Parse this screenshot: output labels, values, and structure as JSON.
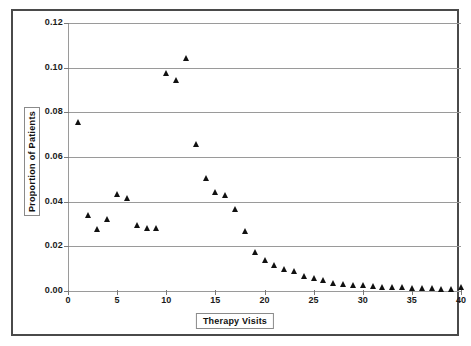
{
  "chart_data": {
    "type": "scatter",
    "title": "",
    "xlabel": "Therapy Visits",
    "ylabel": "Proportion of Patients",
    "xlim": [
      0,
      40
    ],
    "ylim": [
      0.0,
      0.12
    ],
    "grid": true,
    "legend": null,
    "marker": "triangle",
    "marker_color": "#111111",
    "x_ticks": [
      0,
      5,
      10,
      15,
      20,
      25,
      30,
      35,
      40
    ],
    "x_tick_labels": [
      "0",
      "5",
      "10",
      "15",
      "20",
      "25",
      "30",
      "35",
      "40"
    ],
    "y_ticks": [
      0.0,
      0.02,
      0.04,
      0.06,
      0.08,
      0.1,
      0.12
    ],
    "y_tick_labels": [
      "0.00",
      "0.02",
      "0.04",
      "0.06",
      "0.08",
      "0.10",
      "0.12"
    ],
    "x": [
      1,
      2,
      3,
      4,
      5,
      6,
      7,
      8,
      9,
      10,
      11,
      12,
      13,
      14,
      15,
      16,
      17,
      18,
      19,
      20,
      21,
      22,
      23,
      24,
      25,
      26,
      27,
      28,
      29,
      30,
      31,
      32,
      33,
      34,
      35,
      36,
      37,
      38,
      39,
      40
    ],
    "y": [
      0.0755,
      0.034,
      0.0278,
      0.0322,
      0.0435,
      0.0415,
      0.0295,
      0.0282,
      0.0283,
      0.0975,
      0.0945,
      0.1045,
      0.066,
      0.0505,
      0.0443,
      0.0428,
      0.0365,
      0.0268,
      0.0175,
      0.014,
      0.0118,
      0.0097,
      0.0088,
      0.0068,
      0.006,
      0.005,
      0.0038,
      0.003,
      0.0025,
      0.0025,
      0.0022,
      0.002,
      0.0018,
      0.0016,
      0.0015,
      0.0013,
      0.0012,
      0.001,
      0.0009,
      0.0018
    ]
  },
  "colors": {
    "frame": "#4a4a4a",
    "gridline": "#9a9a9a",
    "text": "#111111",
    "marker": "#111111"
  }
}
